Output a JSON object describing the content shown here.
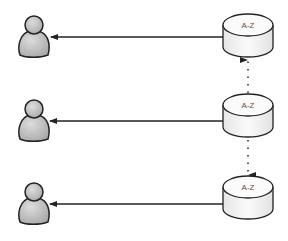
{
  "diagram": {
    "nodes": [
      {
        "id": "user-1",
        "type": "person",
        "label": ""
      },
      {
        "id": "user-2",
        "type": "person",
        "label": ""
      },
      {
        "id": "user-3",
        "type": "person",
        "label": ""
      },
      {
        "id": "db-1",
        "type": "database",
        "label": "A-Z"
      },
      {
        "id": "db-2",
        "type": "database",
        "label": "A-Z"
      },
      {
        "id": "db-3",
        "type": "database",
        "label": "A-Z"
      }
    ],
    "edges": [
      {
        "from": "db-1",
        "to": "user-1",
        "style": "solid"
      },
      {
        "from": "db-2",
        "to": "user-2",
        "style": "solid"
      },
      {
        "from": "db-3",
        "to": "user-3",
        "style": "solid"
      },
      {
        "from": "db-2",
        "to": "db-1",
        "style": "dotted"
      },
      {
        "from": "db-2",
        "to": "db-3",
        "style": "dotted"
      }
    ],
    "colors": {
      "stroke": "#222222",
      "person_fill": "#c4c4c4",
      "db_fill": "#f4f4f4",
      "label": "#555555"
    }
  }
}
